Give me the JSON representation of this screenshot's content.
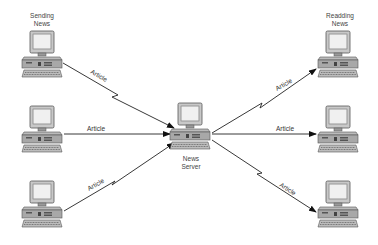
{
  "diagram": {
    "labels": {
      "sending": "Sending\nNews",
      "sending_line1": "Sending",
      "sending_line2": "News",
      "reading_line1": "Readding",
      "reading_line2": "News",
      "server_line1": "News",
      "server_line2": "Server"
    },
    "nodes": [
      {
        "id": "sender-top",
        "role": "client"
      },
      {
        "id": "sender-middle",
        "role": "client"
      },
      {
        "id": "sender-bottom",
        "role": "client"
      },
      {
        "id": "news-server",
        "role": "server"
      },
      {
        "id": "reader-top",
        "role": "client"
      },
      {
        "id": "reader-middle",
        "role": "client"
      },
      {
        "id": "reader-bottom",
        "role": "client"
      }
    ],
    "edges": [
      {
        "from": "sender-top",
        "to": "news-server",
        "label": "Article",
        "style": "lightning"
      },
      {
        "from": "sender-middle",
        "to": "news-server",
        "label": "Article",
        "style": "straight"
      },
      {
        "from": "sender-bottom",
        "to": "news-server",
        "label": "Article",
        "style": "lightning"
      },
      {
        "from": "news-server",
        "to": "reader-top",
        "label": "Article",
        "style": "lightning"
      },
      {
        "from": "news-server",
        "to": "reader-middle",
        "label": "Article",
        "style": "straight"
      },
      {
        "from": "news-server",
        "to": "reader-bottom",
        "label": "Article",
        "style": "lightning"
      }
    ],
    "edge_label": "Article"
  }
}
